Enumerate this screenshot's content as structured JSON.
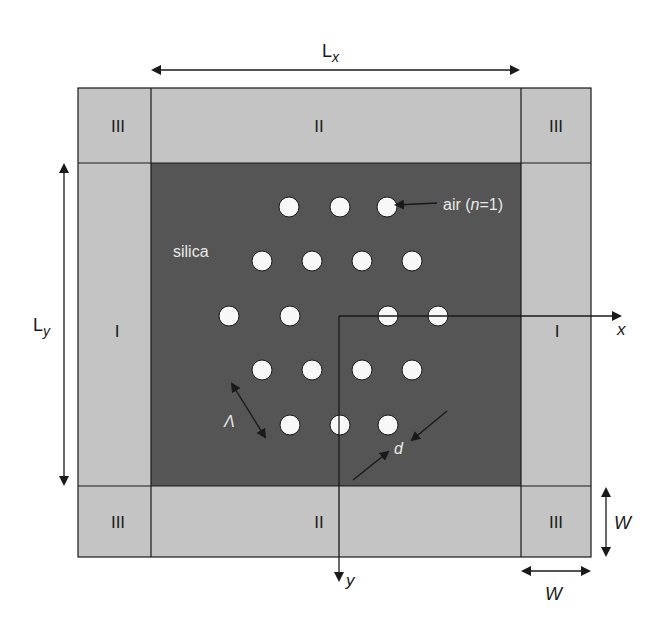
{
  "diagram": {
    "colors": {
      "pml_region": "#c4c4c4",
      "core_silica": "#555555",
      "hole_air": "#f8f8f8",
      "lines": "#1a1a1a",
      "core_text": "#e6e6e6"
    },
    "regions": {
      "corner_label": "III",
      "edge_horizontal_label": "II",
      "edge_vertical_label": "I"
    },
    "dimensions": {
      "lx_label": "L",
      "lx_sub": "x",
      "ly_label": "L",
      "ly_sub": "y",
      "w_vertical_label": "W",
      "w_horizontal_label": "W"
    },
    "axes": {
      "x_label": "x",
      "y_label": "y"
    },
    "annotations": {
      "material_label": "silica",
      "air_label_prefix": "air (",
      "air_label_n": "n",
      "air_label_suffix": "=1)",
      "pitch_label": "Λ",
      "diameter_label": "d"
    },
    "holes": [
      {
        "cx": 289,
        "cy": 207
      },
      {
        "cx": 340,
        "cy": 207
      },
      {
        "cx": 387,
        "cy": 207
      },
      {
        "cx": 262,
        "cy": 261
      },
      {
        "cx": 312,
        "cy": 261
      },
      {
        "cx": 362,
        "cy": 261
      },
      {
        "cx": 412,
        "cy": 261
      },
      {
        "cx": 229,
        "cy": 316
      },
      {
        "cx": 290,
        "cy": 316
      },
      {
        "cx": 388,
        "cy": 316
      },
      {
        "cx": 438,
        "cy": 316
      },
      {
        "cx": 262,
        "cy": 370
      },
      {
        "cx": 312,
        "cy": 370
      },
      {
        "cx": 362,
        "cy": 370
      },
      {
        "cx": 412,
        "cy": 370
      },
      {
        "cx": 290,
        "cy": 425
      },
      {
        "cx": 340,
        "cy": 425
      },
      {
        "cx": 388,
        "cy": 425
      }
    ],
    "hole_radius": 10
  }
}
